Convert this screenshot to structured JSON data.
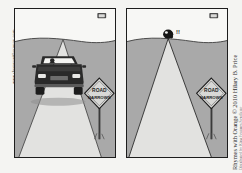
{
  "comic": {
    "title": "Rhymes with Orange",
    "copyright": "Rhymes with Orange © 2010 Hilary B. Price",
    "syndicate_credit": "Distributed by King Features Syndicate",
    "left_margin_credit": "www.rhymeswithorange.com",
    "panel_count": 2,
    "palette": {
      "ink": "#1d1d1d",
      "sky": "#f7f7f5",
      "ground": "#a9a9a9",
      "road": "#e2e2e0",
      "sign_face": "#d8d8d6",
      "car_body": "#2a2a2a",
      "windshield": "#f2f2f0",
      "panel_border": "#1d1d1d",
      "paper": "#ffffff"
    },
    "panels": [
      {
        "index": 1,
        "name": "panel-one-car-on-road",
        "description": "A car drives toward the viewer on a road that tapers to a point on the horizon.",
        "elements": {
          "sky_label": "sky",
          "horizon_label": "horizon",
          "road_label": "road",
          "ground_label": "roadside ground",
          "car_label": "car",
          "driver_label": "driver",
          "sign_text_line1": "ROAD",
          "sign_text_line2": "NARROWS",
          "sign_shape": "diamond warning sign",
          "corner_marker_label": "distant road sign"
        }
      },
      {
        "index": 2,
        "name": "panel-two-car-squeezed-to-point",
        "description": "The same road, now empty, with the car compressed into a tiny dot at the vanishing point emitting an exclamation.",
        "elements": {
          "sky_label": "sky",
          "horizon_label": "horizon",
          "road_label": "road",
          "ground_label": "roadside ground",
          "squeezed_car_label": "car squeezed to a point",
          "exclamation": "!!",
          "sign_text_line1": "ROAD",
          "sign_text_line2": "NARROWS",
          "sign_shape": "diamond warning sign",
          "corner_marker_label": "distant road sign"
        }
      }
    ]
  }
}
